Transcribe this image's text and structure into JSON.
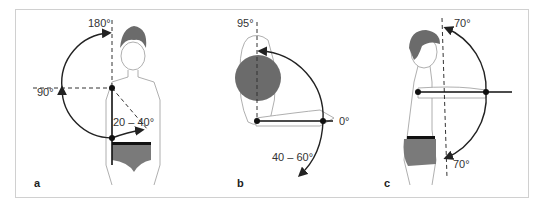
{
  "figure": {
    "panels": [
      {
        "id": "a",
        "label": "a",
        "view": "frontal",
        "angles": {
          "top": "180°",
          "left": "90°",
          "inward": "20 – 40°"
        }
      },
      {
        "id": "b",
        "label": "b",
        "view": "top-down",
        "angles": {
          "top": "95°",
          "right": "0°",
          "bottom": "40 – 60°"
        }
      },
      {
        "id": "c",
        "label": "c",
        "view": "lateral",
        "angles": {
          "top": "70°",
          "bottom": "70°"
        }
      }
    ],
    "colors": {
      "line": "#222222",
      "dashed": "#333333",
      "hair": "#6b6b6b",
      "underwear": "#7a7a7a",
      "outline": "#9a9a9a",
      "frame": "#d0d0d0"
    }
  }
}
